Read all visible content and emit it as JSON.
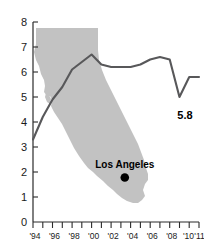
{
  "chart_data": {
    "type": "line",
    "title": "",
    "subtitle": "",
    "xlabel": "",
    "ylabel": "",
    "xlim": [
      1994,
      2011
    ],
    "ylim": [
      0,
      8
    ],
    "grid": false,
    "legend": "none",
    "x": [
      1994,
      1995,
      1996,
      1997,
      1998,
      1999,
      2000,
      2001,
      2002,
      2003,
      2004,
      2005,
      2006,
      2007,
      2008,
      2009,
      2010,
      2011
    ],
    "series": [
      {
        "name": "Unemployment rate",
        "values": [
          3.3,
          4.2,
          4.9,
          5.4,
          6.1,
          6.4,
          6.7,
          6.3,
          6.2,
          6.2,
          6.2,
          6.3,
          6.5,
          6.6,
          6.5,
          5.0,
          5.8,
          5.8
        ]
      }
    ],
    "y_tick_labels": [
      "0",
      "1",
      "2",
      "3",
      "4",
      "5",
      "6",
      "7",
      "8"
    ],
    "y_tick_values": [
      0,
      1,
      2,
      3,
      4,
      5,
      6,
      7,
      8
    ],
    "x_tick_values": [
      1994,
      1995,
      1996,
      1997,
      1998,
      1999,
      2000,
      2001,
      2002,
      2003,
      2004,
      2005,
      2006,
      2007,
      2008,
      2009,
      2010,
      2011
    ],
    "x_tick_labels": [
      "'94",
      "",
      "'96",
      "",
      "'98",
      "",
      "'00",
      "",
      "'02",
      "",
      "'04",
      "",
      "'06",
      "",
      "'08",
      "",
      "'10",
      "'11"
    ],
    "annotations": [
      {
        "name": "end-value-label",
        "text": "5.8",
        "x": 2010,
        "y": 4.6
      },
      {
        "name": "city-label",
        "text": "Los Angeles",
        "x": 2003,
        "y": 2.3
      }
    ],
    "map_overlay": {
      "name": "california-state-shape",
      "fill": "#c2c2c2",
      "city_marker": {
        "label": "Los Angeles",
        "x": 2003.4,
        "y": 1.78
      }
    }
  },
  "labels": {
    "end_value": "5.8",
    "city": "Los Angeles",
    "y_0": "0",
    "y_1": "1",
    "y_2": "2",
    "y_3": "3",
    "y_4": "4",
    "y_5": "5",
    "y_6": "6",
    "y_7": "7",
    "y_8": "8",
    "x_94": "'94",
    "x_96": "'96",
    "x_98": "'98",
    "x_00": "'00",
    "x_02": "'02",
    "x_04": "'04",
    "x_06": "'06",
    "x_08": "'08",
    "x_10": "'10",
    "x_11": "'11"
  },
  "colors": {
    "map_fill": "#c2c2c2",
    "line": "#58585a",
    "axis": "#2b2b2b",
    "text": "#1a1a1a",
    "dot": "#000000",
    "background": "#ffffff"
  }
}
